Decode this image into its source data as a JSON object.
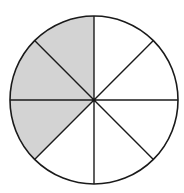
{
  "diagram": {
    "type": "fraction-circle",
    "center": [
      94,
      100
    ],
    "radius": 84,
    "total_sectors": 8,
    "shaded_sectors": 3,
    "fraction_shaded": "3/8",
    "shaded_sector_angles": [
      [
        90,
        135
      ],
      [
        135,
        180
      ],
      [
        180,
        225
      ]
    ],
    "colors": {
      "shade": "#d3d3d3",
      "stroke": "#1a1a1a",
      "background": "#ffffff"
    }
  }
}
